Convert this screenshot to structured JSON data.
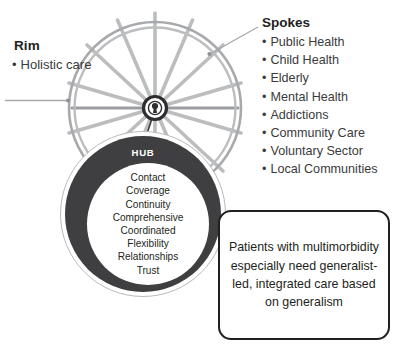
{
  "rim": {
    "heading": "Rim",
    "bullet_glyph": "•",
    "items": [
      "Holistic care"
    ]
  },
  "spokes": {
    "heading": "Spokes",
    "bullet_glyph": "•",
    "items": [
      "Public Health",
      "Child Health",
      "Elderly",
      "Mental Health",
      "Addictions",
      "Community Care",
      "Voluntary Sector",
      "Local Communities"
    ]
  },
  "hub": {
    "title": "HUB",
    "words": [
      "Contact",
      "Coverage",
      "Continuity",
      "Comprehensive",
      "Coordinated",
      "Flexibility",
      "Relationships",
      "Trust"
    ]
  },
  "callout": {
    "text": "Patients with multimorbidity especially need generalist-led, integrated care based on generalism"
  },
  "colors": {
    "ink": "#231f20",
    "body_text": "#3a3a3c",
    "hub_dark": "#3f3f41",
    "wheel_gray": "#a7a9ac",
    "wheel_gray_light": "#c8c9cb",
    "leader_gray": "#a7a9ac",
    "background": "#ffffff"
  }
}
